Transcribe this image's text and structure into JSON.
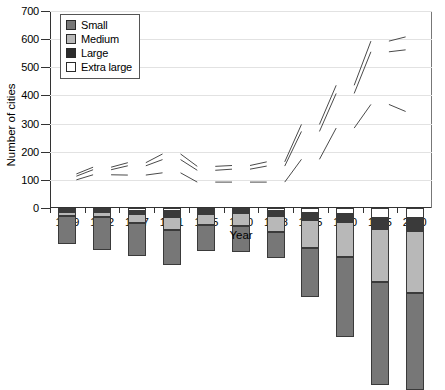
{
  "chart_data": {
    "type": "bar",
    "title": "",
    "xlabel": "Year",
    "ylabel": "Number of cities",
    "ylim": [
      0,
      700
    ],
    "yticks": [
      0,
      100,
      200,
      300,
      400,
      500,
      600,
      700
    ],
    "grid": true,
    "stacked": true,
    "legend_position": "top-left",
    "categories": [
      "1949",
      "1952",
      "1957",
      "1961",
      "1965",
      "1970",
      "1978",
      "1985",
      "1990",
      "1995",
      "2000"
    ],
    "series": [
      {
        "name": "Small",
        "color": "#777777",
        "values": [
          100,
          118,
          117,
          125,
          92,
          92,
          92,
          173,
          284,
          368,
          343
        ]
      },
      {
        "name": "Medium",
        "color": "#b8b8b8",
        "values": [
          13,
          18,
          33,
          47,
          42,
          46,
          57,
          99,
          123,
          187,
          219
        ]
      },
      {
        "name": "Large",
        "color": "#3a3a3a",
        "values": [
          8,
          9,
          11,
          20,
          14,
          13,
          15,
          25,
          29,
          38,
          46
        ]
      },
      {
        "name": "Extra large",
        "color": "#ffffff",
        "values": [
          7,
          6,
          9,
          12,
          6,
          6,
          12,
          18,
          22,
          37,
          37
        ]
      }
    ],
    "totals": [
      128,
      151,
      170,
      204,
      154,
      157,
      176,
      315,
      458,
      630,
      645
    ]
  },
  "legend": {
    "items": [
      {
        "label": "Small",
        "icon": "legend-swatch-small-icon"
      },
      {
        "label": "Medium",
        "icon": "legend-swatch-medium-icon"
      },
      {
        "label": "Large",
        "icon": "legend-swatch-large-icon"
      },
      {
        "label": "Extra large",
        "icon": "legend-swatch-extra-large-icon"
      }
    ]
  }
}
